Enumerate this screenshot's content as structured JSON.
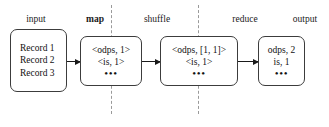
{
  "diagram": {
    "background_color": "#ffffff",
    "line_color": "#3c3c3c",
    "divider_color": "#9a9a9a",
    "stage_labels": [
      {
        "name": "input",
        "text": "input",
        "bold": false
      },
      {
        "name": "map",
        "text": "map",
        "bold": true
      },
      {
        "name": "shuffle",
        "text": "shuffle",
        "bold": false
      },
      {
        "name": "reduce",
        "text": "reduce",
        "bold": false
      },
      {
        "name": "output",
        "text": "output",
        "bold": false
      }
    ],
    "boxes": {
      "input": {
        "label": "input-records-box",
        "lines": [
          "Record 1",
          "Record 2",
          "Record 3"
        ],
        "ellipsis": ""
      },
      "map": {
        "label": "map-output-box",
        "lines": [
          "<odps,  1>",
          "<is,  1>"
        ],
        "ellipsis": "•••"
      },
      "shuffle": {
        "label": "shuffle-output-box",
        "lines": [
          "<odps,  [1,  1]>",
          "<is,  1>"
        ],
        "ellipsis": "•••"
      },
      "reduce": {
        "label": "reduce-output-box",
        "lines": [
          "odps,  2",
          "is,  1"
        ],
        "ellipsis": "•••"
      }
    },
    "arrows": [
      {
        "name": "arrow-input-to-map"
      },
      {
        "name": "arrow-map-to-shuffle"
      },
      {
        "name": "arrow-shuffle-to-reduce"
      }
    ],
    "dividers": [
      {
        "name": "divider-map-shuffle"
      },
      {
        "name": "divider-shuffle-reduce"
      }
    ]
  }
}
